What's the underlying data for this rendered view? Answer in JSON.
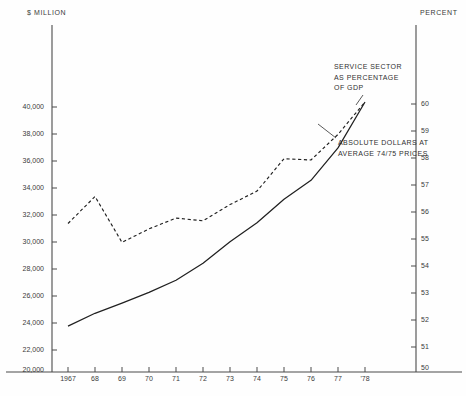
{
  "chart_data": {
    "type": "line",
    "title": "",
    "xlabel": "",
    "ylabel": "$ MILLION",
    "y2label": "PERCENT",
    "grid": false,
    "legend_position": "inline-annotation",
    "x": [
      1967,
      1968,
      1969,
      1970,
      1971,
      1972,
      1973,
      1974,
      1975,
      1976,
      1977,
      1978
    ],
    "xtick_labels": [
      "1967",
      "68",
      "69",
      "70",
      "71",
      "72",
      "73",
      "74",
      "75",
      "76",
      "77",
      "'78"
    ],
    "ylim": [
      20000,
      41000
    ],
    "ytick_labels": [
      "40,000",
      "38,000",
      "36,000",
      "34,000",
      "32,000",
      "30,000",
      "28,000",
      "26,000",
      "24,000",
      "22,000",
      "20,000"
    ],
    "ytick_values": [
      40000,
      38000,
      36000,
      34000,
      32000,
      30000,
      28000,
      26000,
      24000,
      22000,
      20000
    ],
    "y2lim": [
      50,
      60.5
    ],
    "y2tick_labels": [
      "60",
      "59",
      "58",
      "57",
      "56",
      "55",
      "54",
      "53",
      "52",
      "51",
      "50"
    ],
    "y2tick_values": [
      60,
      59,
      58,
      57,
      56,
      55,
      54,
      53,
      52,
      51,
      50
    ],
    "series": [
      {
        "name": "ABSOLUTE DOLLARS AT AVERAGE 74/75 PRICES",
        "axis": "left",
        "style": "solid",
        "color": "#202020",
        "values": [
          23400,
          24350,
          25100,
          25900,
          26800,
          28050,
          29650,
          31050,
          32800,
          34200,
          36600,
          40000
        ]
      },
      {
        "name": "SERVICE SECTOR AS PERCENTAGE OF GDP",
        "axis": "right",
        "style": "dashed",
        "color": "#202020",
        "values": [
          55.5,
          56.5,
          54.8,
          55.3,
          55.7,
          55.6,
          56.2,
          56.7,
          57.9,
          57.85,
          58.8,
          60.0
        ]
      }
    ],
    "annotations": [
      {
        "id": "service-sector",
        "lines": [
          "SERVICE SECTOR",
          "AS PERCENTAGE",
          "OF GDP"
        ],
        "points_to": "dashed-series"
      },
      {
        "id": "absolute-dollars",
        "lines": [
          "ABSOLUTE DOLLARS AT",
          "AVERAGE 74/75 PRICES"
        ],
        "points_to": "solid-series"
      }
    ]
  }
}
